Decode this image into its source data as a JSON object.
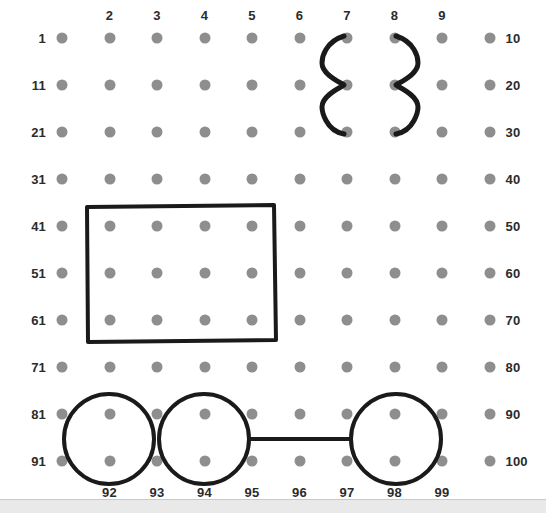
{
  "page": {
    "background_color": "#ffffff",
    "dot_color": "#8e8e8e",
    "ink_color": "#1a1a1a",
    "label_color": "#2b2b2b",
    "footer_band_color": "#e9e9e9"
  },
  "grid": {
    "rows": 10,
    "cols": 10,
    "origin_x": 62,
    "origin_y": 38,
    "col_step": 47.5,
    "row_step": 47,
    "dot_radius": 5.5,
    "numbers_start": 1,
    "numbers_end": 100
  },
  "labels": {
    "column_headers": [
      "2",
      "3",
      "4",
      "5",
      "6",
      "7",
      "8",
      "9"
    ],
    "column_header_cols": [
      2,
      3,
      4,
      5,
      6,
      7,
      8,
      9
    ],
    "column_header_y": 15,
    "row_start_labels": [
      "1",
      "11",
      "21",
      "31",
      "41",
      "51",
      "61",
      "71",
      "81",
      "91"
    ],
    "row_end_labels": [
      "10",
      "20",
      "30",
      "40",
      "50",
      "60",
      "70",
      "80",
      "90",
      "100"
    ],
    "bottom_labels": [
      "92",
      "93",
      "94",
      "95",
      "96",
      "97",
      "98",
      "99"
    ],
    "bottom_label_cols": [
      2,
      3,
      4,
      5,
      6,
      7,
      8,
      9
    ],
    "bottom_label_y": 492
  },
  "annotations": {
    "brace_left": {
      "name": "left-curly-brace",
      "x": 322,
      "top_y": 36,
      "bottom_y": 134,
      "tip_y": 85,
      "width": 22,
      "stroke": 5
    },
    "brace_right": {
      "name": "right-curly-brace",
      "x": 418,
      "top_y": 36,
      "bottom_y": 134,
      "tip_y": 85,
      "width": 22,
      "stroke": 5
    },
    "rectangle": {
      "name": "rectangle-outline",
      "x": 86,
      "y": 205,
      "width": 190,
      "height": 137,
      "stroke": 4,
      "covers_numbers": [
        41,
        42,
        43,
        44,
        51,
        52,
        53,
        54,
        61,
        62,
        63,
        64
      ]
    },
    "circles": [
      {
        "name": "circle-92",
        "cx": 109,
        "cy": 439,
        "r": 45,
        "stroke": 4
      },
      {
        "name": "circle-94",
        "cx": 204,
        "cy": 439,
        "r": 45,
        "stroke": 4
      },
      {
        "name": "circle-98",
        "cx": 396,
        "cy": 439,
        "r": 45,
        "stroke": 4
      }
    ],
    "connector_line": {
      "name": "circle-connector-line",
      "x1": 249,
      "y1": 439,
      "x2": 351,
      "y2": 439,
      "stroke": 4
    }
  }
}
